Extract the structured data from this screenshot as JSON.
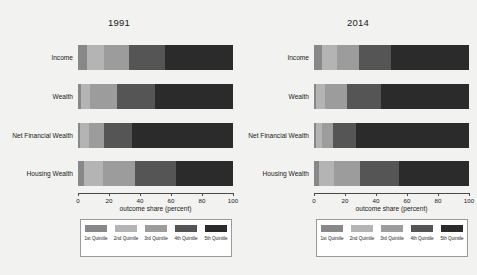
{
  "figure": {
    "background_color": "#f2f2f0",
    "axis_label": "outcome share (percent)",
    "xticks": [
      "0",
      "20",
      "40",
      "60",
      "80",
      "100"
    ],
    "categories": [
      "Income",
      "Wealth",
      "Net Financial Wealth",
      "Housing Wealth"
    ],
    "quintiles": [
      "1st Quintile",
      "2nd Quintile",
      "3rd Quintile",
      "4th Quintile",
      "5th Quintile"
    ],
    "quintile_colors": [
      "#888888",
      "#b4b4b4",
      "#9c9c9c",
      "#555555",
      "#2b2b2b"
    ]
  },
  "panels": [
    {
      "title": "1991"
    },
    {
      "title": "2014"
    }
  ],
  "chart_data": [
    {
      "type": "bar",
      "orientation": "horizontal",
      "stacked": true,
      "title": "1991",
      "xlabel": "outcome share (percent)",
      "ylabel": "",
      "xlim": [
        0,
        100
      ],
      "xticks": [
        0,
        20,
        40,
        60,
        80,
        100
      ],
      "grid": false,
      "legend_position": "bottom",
      "categories": [
        "Income",
        "Wealth",
        "Net Financial Wealth",
        "Housing Wealth"
      ],
      "series": [
        {
          "name": "1st Quintile",
          "color": "#888888",
          "values": [
            6,
            2,
            1,
            4
          ]
        },
        {
          "name": "2nd Quintile",
          "color": "#b4b4b4",
          "values": [
            11,
            6,
            6,
            12
          ]
        },
        {
          "name": "3rd Quintile",
          "color": "#9c9c9c",
          "values": [
            16,
            17,
            10,
            21
          ]
        },
        {
          "name": "4th Quintile",
          "color": "#555555",
          "values": [
            23,
            25,
            18,
            26
          ]
        },
        {
          "name": "5th Quintile",
          "color": "#2b2b2b",
          "values": [
            44,
            50,
            65,
            37
          ]
        }
      ]
    },
    {
      "type": "bar",
      "orientation": "horizontal",
      "stacked": true,
      "title": "2014",
      "xlabel": "outcome share (percent)",
      "ylabel": "",
      "xlim": [
        0,
        100
      ],
      "xticks": [
        0,
        20,
        40,
        60,
        80,
        100
      ],
      "grid": false,
      "legend_position": "bottom",
      "categories": [
        "Income",
        "Wealth",
        "Net Financial Wealth",
        "Housing Wealth"
      ],
      "series": [
        {
          "name": "1st Quintile",
          "color": "#888888",
          "values": [
            5,
            1,
            1,
            3
          ]
        },
        {
          "name": "2nd Quintile",
          "color": "#b4b4b4",
          "values": [
            10,
            6,
            4,
            10
          ]
        },
        {
          "name": "3rd Quintile",
          "color": "#9c9c9c",
          "values": [
            14,
            14,
            7,
            17
          ]
        },
        {
          "name": "4th Quintile",
          "color": "#555555",
          "values": [
            21,
            22,
            15,
            25
          ]
        },
        {
          "name": "5th Quintile",
          "color": "#2b2b2b",
          "values": [
            50,
            57,
            73,
            45
          ]
        }
      ]
    }
  ]
}
